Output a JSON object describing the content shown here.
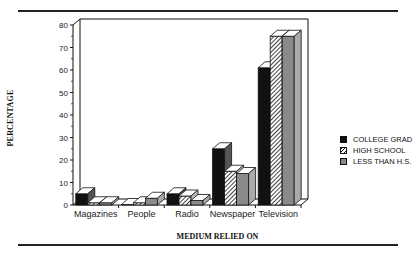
{
  "chart_data": {
    "type": "bar",
    "style": "3d-clustered",
    "title": "",
    "xlabel": "MEDIUM RELIED ON",
    "ylabel": "PERCENTAGE",
    "ylim": [
      0,
      80
    ],
    "yticks": [
      0,
      10,
      20,
      30,
      40,
      50,
      60,
      70,
      80
    ],
    "grid": false,
    "legend_position": "right",
    "categories": [
      "Magazines",
      "People",
      "Radio",
      "Newspaper",
      "Television"
    ],
    "series": [
      {
        "name": "COLLEGE GRAD",
        "pattern": "solid-black",
        "values": [
          5,
          0,
          5,
          25,
          61
        ]
      },
      {
        "name": "HIGH SCHOOL",
        "pattern": "hatched",
        "values": [
          1,
          1,
          4,
          15,
          75
        ]
      },
      {
        "name": "LESS THAN H.S.",
        "pattern": "gray",
        "values": [
          1,
          3,
          2,
          14,
          75
        ]
      }
    ]
  },
  "labels": {
    "ylabel": "PERCENTAGE",
    "xlabel": "MEDIUM RELIED ON",
    "legend": [
      "COLLEGE GRAD",
      "HIGH SCHOOL",
      "LESS THAN H.S."
    ]
  }
}
